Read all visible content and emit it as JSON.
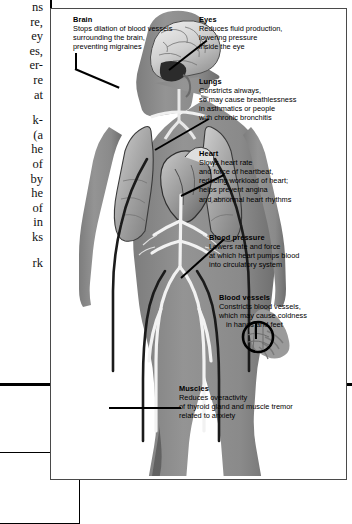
{
  "page": {
    "left_column_lines": [
      "ns",
      "re,",
      "ey",
      "es,",
      "er-",
      "re",
      "at",
      "GAP",
      "k-",
      "(a",
      "he",
      "of",
      "by",
      "he",
      "of",
      "in",
      "ks",
      "GAP",
      "rk"
    ]
  },
  "figure": {
    "labels": [
      {
        "id": "brain",
        "heading": "Brain",
        "lines": [
          "Stops dilation of blood vessels",
          "surrounding the brain,",
          "preventing migraines"
        ]
      },
      {
        "id": "eyes",
        "heading": "Eyes",
        "lines": [
          "Reduces fluid production,",
          "lowering pressure",
          "inside the eye"
        ]
      },
      {
        "id": "lungs",
        "heading": "Lungs",
        "lines": [
          "Constricts airways,",
          "so may cause breathlessness",
          "in asthmatics or people",
          "with chronic bronchitis"
        ]
      },
      {
        "id": "heart",
        "heading": "Heart",
        "lines": [
          "Slows heart rate",
          "and force of heartbeat,",
          "reducing workload of heart;",
          "helps prevent angina",
          "and abnormal heart rhythms"
        ]
      },
      {
        "id": "blood-pressure",
        "heading": "Blood pressure",
        "lines": [
          "Lowers rate and force",
          "at which heart pumps blood",
          "into circulatory system"
        ]
      },
      {
        "id": "blood-vessels",
        "heading": "Blood vessels",
        "lines": [
          "Constricts blood vessels,",
          "which may cause coldness",
          "in hands and feet"
        ]
      },
      {
        "id": "muscles",
        "heading": "Muscles",
        "lines": [
          "Reduces overactivity",
          "of thyroid gland and muscle tremor",
          "related to anxiety"
        ]
      }
    ],
    "anatomy_parts": [
      "body-silhouette",
      "brain",
      "lungs",
      "heart",
      "arteries",
      "leg-muscles",
      "hand-vessel-detail"
    ]
  },
  "colors": {
    "body_gray": "#8e8e8e",
    "body_gray_dark": "#6f6f6f",
    "organ_light": "#d8d8d8",
    "organ_mid": "#a8a8a8",
    "outline": "#000000",
    "frame": "#4a4a4a",
    "page_bg": "#ffffff"
  }
}
